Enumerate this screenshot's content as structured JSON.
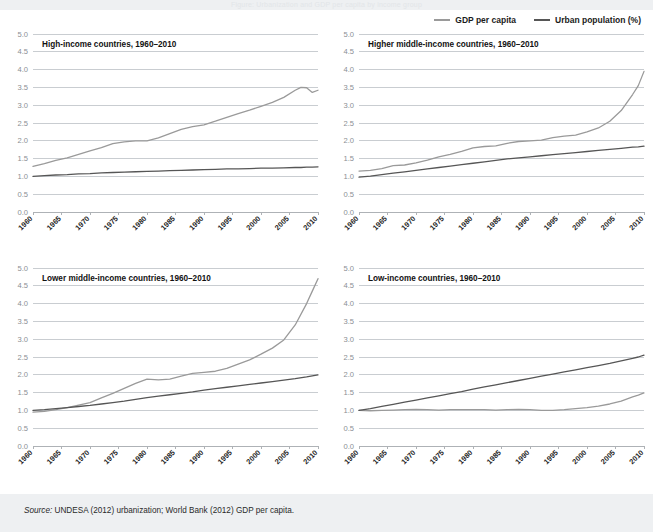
{
  "page": {
    "banner_ghost_text": "Figure: Urbanization and GDP per capita by income group",
    "source_prefix": "Source:",
    "source_text": "UNDESA (2012) urbanization; World Bank (2012) GDP per capita."
  },
  "legend": {
    "position": "top-right",
    "items": [
      {
        "label": "GDP per capita",
        "color": "#9a9a9a"
      },
      {
        "label": "Urban population (%)",
        "color": "#565656"
      }
    ]
  },
  "axes": {
    "y_ticks": [
      "5.0",
      "4.5",
      "4.0",
      "3.5",
      "3.0",
      "2.5",
      "2.0",
      "1.5",
      "1.0",
      "0.5",
      "0.0"
    ],
    "y_values": [
      5.0,
      4.5,
      4.0,
      3.5,
      3.0,
      2.5,
      2.0,
      1.5,
      1.0,
      0.5,
      0.0
    ],
    "ylim": [
      0.0,
      5.0
    ],
    "x_ticks": [
      "1960",
      "1965",
      "1970",
      "1975",
      "1980",
      "1985",
      "1990",
      "1995",
      "2000",
      "2005",
      "2010"
    ],
    "xlim": [
      1960,
      2010
    ],
    "grid": true
  },
  "chart_data": [
    {
      "type": "line",
      "title": "High-income countries, 1960–2010",
      "xlabel": "",
      "ylabel": "",
      "ylim": [
        0.0,
        5.0
      ],
      "xlim": [
        1960,
        2010
      ],
      "x": [
        1960,
        1962,
        1964,
        1966,
        1968,
        1970,
        1972,
        1974,
        1976,
        1978,
        1980,
        1982,
        1984,
        1986,
        1988,
        1990,
        1992,
        1994,
        1996,
        1998,
        2000,
        2002,
        2004,
        2006,
        2007,
        2008,
        2009,
        2010
      ],
      "series": [
        {
          "name": "GDP per capita",
          "color": "#9a9a9a",
          "values": [
            1.28,
            1.36,
            1.45,
            1.52,
            1.62,
            1.72,
            1.81,
            1.92,
            1.97,
            2.0,
            2.0,
            2.08,
            2.2,
            2.32,
            2.4,
            2.45,
            2.55,
            2.66,
            2.76,
            2.86,
            2.97,
            3.08,
            3.22,
            3.42,
            3.5,
            3.49,
            3.36,
            3.42
          ]
        },
        {
          "name": "Urban population (%)",
          "color": "#565656",
          "values": [
            1.0,
            1.02,
            1.04,
            1.05,
            1.07,
            1.08,
            1.1,
            1.11,
            1.12,
            1.13,
            1.14,
            1.15,
            1.16,
            1.17,
            1.18,
            1.19,
            1.2,
            1.21,
            1.21,
            1.22,
            1.23,
            1.23,
            1.24,
            1.25,
            1.25,
            1.26,
            1.26,
            1.27
          ]
        }
      ]
    },
    {
      "type": "line",
      "title": "Higher middle-income countries, 1960–2010",
      "xlabel": "",
      "ylabel": "",
      "ylim": [
        0.0,
        5.0
      ],
      "xlim": [
        1960,
        2010
      ],
      "x": [
        1960,
        1962,
        1964,
        1966,
        1968,
        1970,
        1972,
        1974,
        1976,
        1978,
        1980,
        1982,
        1984,
        1986,
        1988,
        1990,
        1992,
        1994,
        1996,
        1998,
        2000,
        2002,
        2004,
        2006,
        2008,
        2009,
        2010
      ],
      "series": [
        {
          "name": "GDP per capita",
          "color": "#9a9a9a",
          "values": [
            1.15,
            1.17,
            1.22,
            1.3,
            1.32,
            1.38,
            1.46,
            1.55,
            1.62,
            1.7,
            1.8,
            1.84,
            1.86,
            1.93,
            1.98,
            2.0,
            2.02,
            2.09,
            2.13,
            2.16,
            2.25,
            2.36,
            2.55,
            2.85,
            3.3,
            3.55,
            3.95
          ]
        },
        {
          "name": "Urban population (%)",
          "color": "#565656",
          "values": [
            0.98,
            1.01,
            1.05,
            1.09,
            1.13,
            1.17,
            1.21,
            1.25,
            1.29,
            1.33,
            1.37,
            1.41,
            1.45,
            1.49,
            1.52,
            1.55,
            1.58,
            1.61,
            1.64,
            1.67,
            1.7,
            1.73,
            1.76,
            1.79,
            1.82,
            1.83,
            1.85
          ]
        }
      ]
    },
    {
      "type": "line",
      "title": "Lower middle-income countries, 1960–2010",
      "xlabel": "",
      "ylabel": "",
      "ylim": [
        0.0,
        5.0
      ],
      "xlim": [
        1960,
        2010
      ],
      "x": [
        1960,
        1962,
        1964,
        1966,
        1968,
        1970,
        1972,
        1974,
        1976,
        1978,
        1980,
        1982,
        1984,
        1986,
        1988,
        1990,
        1992,
        1994,
        1996,
        1998,
        2000,
        2002,
        2004,
        2006,
        2008,
        2009,
        2010
      ],
      "series": [
        {
          "name": "GDP per capita",
          "color": "#9a9a9a",
          "values": [
            0.95,
            0.97,
            1.02,
            1.08,
            1.15,
            1.22,
            1.35,
            1.48,
            1.62,
            1.76,
            1.88,
            1.86,
            1.88,
            1.96,
            2.04,
            2.07,
            2.1,
            2.18,
            2.3,
            2.42,
            2.58,
            2.75,
            2.98,
            3.4,
            4.0,
            4.35,
            4.7
          ]
        },
        {
          "name": "Urban population (%)",
          "color": "#565656",
          "values": [
            1.0,
            1.02,
            1.05,
            1.08,
            1.11,
            1.14,
            1.18,
            1.22,
            1.26,
            1.31,
            1.36,
            1.4,
            1.44,
            1.48,
            1.52,
            1.57,
            1.61,
            1.65,
            1.69,
            1.73,
            1.77,
            1.81,
            1.85,
            1.89,
            1.94,
            1.97,
            2.0
          ]
        }
      ]
    },
    {
      "type": "line",
      "title": "Low-income countries, 1960–2010",
      "xlabel": "",
      "ylabel": "",
      "ylim": [
        0.0,
        5.0
      ],
      "xlim": [
        1960,
        2010
      ],
      "x": [
        1960,
        1962,
        1964,
        1966,
        1968,
        1970,
        1972,
        1974,
        1976,
        1978,
        1980,
        1982,
        1984,
        1986,
        1988,
        1990,
        1992,
        1994,
        1996,
        1998,
        2000,
        2002,
        2004,
        2006,
        2008,
        2009,
        2010
      ],
      "series": [
        {
          "name": "GDP per capita",
          "color": "#9a9a9a",
          "values": [
            1.0,
            0.99,
            1.0,
            1.01,
            1.02,
            1.03,
            1.02,
            1.01,
            1.02,
            1.02,
            1.02,
            1.02,
            1.01,
            1.02,
            1.03,
            1.02,
            1.0,
            1.0,
            1.02,
            1.05,
            1.08,
            1.12,
            1.18,
            1.26,
            1.38,
            1.43,
            1.49
          ]
        },
        {
          "name": "Urban population (%)",
          "color": "#565656",
          "values": [
            1.0,
            1.05,
            1.11,
            1.17,
            1.23,
            1.29,
            1.35,
            1.41,
            1.47,
            1.53,
            1.6,
            1.66,
            1.72,
            1.78,
            1.84,
            1.9,
            1.96,
            2.02,
            2.08,
            2.14,
            2.2,
            2.26,
            2.32,
            2.39,
            2.46,
            2.5,
            2.55
          ]
        }
      ]
    }
  ]
}
